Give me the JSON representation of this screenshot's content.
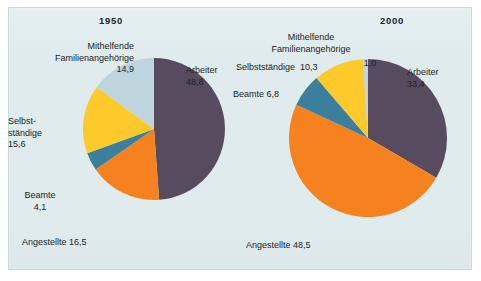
{
  "figure": {
    "background_color": "#dfebed",
    "frame_border_color": "#c8dade"
  },
  "palette": {
    "arbeiter": "#574b60",
    "angestellte": "#f5821f",
    "beamte": "#3c7f9c",
    "selbststaendige": "#fdc92b",
    "mithelfende": "#bdd5dc"
  },
  "charts": [
    {
      "year_label": "1950",
      "labels": {
        "mithelfende": "Mithelfende\nFamilienangehörige\n14,9",
        "selbststaendige": "Selbst-\nständige\n15,6",
        "beamte": "Beamte\n4,1",
        "angestellte": "Angestellte 16,5",
        "arbeiter": "Arbeiter\n48,8"
      }
    },
    {
      "year_label": "2000",
      "labels": {
        "mithelfende": "Mithelfende\nFamilienangehörige",
        "mithelfende_value": "1,0",
        "selbststaendige": "Selbstständige  10,3",
        "beamte": "Beamte 6,8",
        "angestellte": "Angestellte 48,5",
        "arbeiter": "Arbeiter\n33,4"
      }
    }
  ],
  "chart_data": [
    {
      "type": "pie",
      "title": "1950",
      "categories": [
        "Arbeiter",
        "Angestellte",
        "Beamte",
        "Selbstständige",
        "Mithelfende Familienangehörige"
      ],
      "values": [
        48.8,
        16.5,
        4.1,
        15.6,
        14.9
      ],
      "value_labels": [
        "48,8",
        "16,5",
        "4,1",
        "15,6",
        "14,9"
      ],
      "colors": [
        "#574b60",
        "#f5821f",
        "#3c7f9c",
        "#fdc92b",
        "#bdd5dc"
      ],
      "start_angle_deg": 0,
      "direction": "clockwise",
      "unit": "percent",
      "legend": "none",
      "grid": false
    },
    {
      "type": "pie",
      "title": "2000",
      "categories": [
        "Arbeiter",
        "Angestellte",
        "Beamte",
        "Selbstständige",
        "Mithelfende Familienangehörige"
      ],
      "values": [
        33.4,
        48.5,
        6.8,
        10.3,
        1.0
      ],
      "value_labels": [
        "33,4",
        "48,5",
        "6,8",
        "10,3",
        "1,0"
      ],
      "colors": [
        "#574b60",
        "#f5821f",
        "#3c7f9c",
        "#fdc92b",
        "#bdd5dc"
      ],
      "start_angle_deg": 0,
      "direction": "clockwise",
      "unit": "percent",
      "legend": "none",
      "grid": false
    }
  ]
}
